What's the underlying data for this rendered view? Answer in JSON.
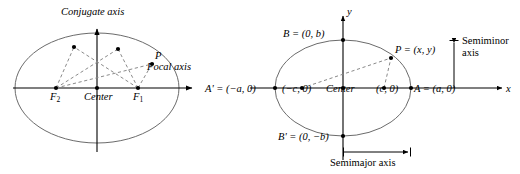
{
  "figure": {
    "background_color": "#ffffff",
    "stroke_color": "#555555",
    "axis_color": "#000000",
    "dashed_color": "#777777",
    "point_color": "#000000",
    "width": 520,
    "height": 174
  },
  "left_diagram": {
    "name": "ellipse-focal-definition",
    "labels": {
      "conjugate_axis": "Conjugate axis",
      "focal_axis": "Focal axis",
      "center": "Center",
      "focus_1_letter": "F",
      "focus_1_sub": "1",
      "focus_2_letter": "F",
      "focus_2_sub": "2",
      "point_p": "P"
    },
    "geometry": {
      "center": [
        97,
        88
      ],
      "semi_major": 82,
      "semi_minor": 55,
      "focus_1": [
        138,
        88
      ],
      "focus_2": [
        56,
        88
      ],
      "point_p": [
        152,
        64
      ],
      "ellipse_points": [
        [
          74,
          47
        ],
        [
          118,
          49
        ],
        [
          152,
          64
        ]
      ],
      "x_axis": [
        13,
        88,
        196,
        88
      ],
      "y_axis": [
        97,
        152,
        97,
        25
      ]
    }
  },
  "right_diagram": {
    "name": "ellipse-standard-position",
    "labels": {
      "y_axis": "y",
      "x_axis": "x",
      "vertex_B": "B = (0, b)",
      "vertex_B_prime": "B' = (0, −b)",
      "vertex_A_prime": "A' = (−a, 0)",
      "vertex_A": "A = (a, 0)",
      "focus_left": "(−c, 0)",
      "focus_right": "(c, 0)",
      "center": "Center",
      "point_p": "P = (x, y)",
      "semiminor_axis": "Semiminor axis",
      "semimajor_axis": "Semimajor axis"
    },
    "geometry": {
      "center": [
        343,
        88
      ],
      "semi_major": 68,
      "semi_minor": 48,
      "vertex_A": [
        411,
        88
      ],
      "vertex_A_prime": [
        275,
        88
      ],
      "vertex_B": [
        343,
        40
      ],
      "vertex_B_prime": [
        343,
        136
      ],
      "focus_right": [
        384,
        88
      ],
      "focus_left": [
        302,
        88
      ],
      "point_p": [
        391,
        58
      ],
      "x_axis": [
        250,
        88,
        506,
        88
      ],
      "y_axis": [
        343,
        160,
        343,
        12
      ],
      "semiminor_bracket": [
        454,
        40,
        454,
        88
      ],
      "semimajor_bracket": [
        343,
        152,
        411,
        152
      ]
    }
  }
}
